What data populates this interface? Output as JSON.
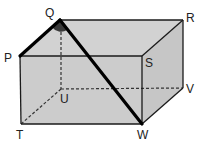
{
  "diagram": {
    "type": "cuboid",
    "colors": {
      "face_fill": "#cfcfcf",
      "edge": "#1a1a1a",
      "highlight": "#000000",
      "angle_marker": "#3a3a3a"
    },
    "vertices": {
      "P": "P",
      "Q": "Q",
      "R": "R",
      "S": "S",
      "T": "T",
      "U": "U",
      "V": "V",
      "W": "W"
    },
    "hidden_edges": [
      "QU",
      "UT",
      "UV"
    ],
    "highlighted_segments": [
      "PQ",
      "QW"
    ],
    "marked_angle": "PQW"
  }
}
